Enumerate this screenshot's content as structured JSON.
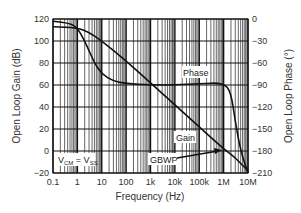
{
  "chart_data": {
    "type": "line",
    "title": "",
    "xlabel": "Frequency (Hz)",
    "ylabel": "Open Loop Gain (dB)",
    "y2label": "Open Loop Phase (°)",
    "xscale": "log",
    "xlim": [
      0.1,
      10000000
    ],
    "ylim": [
      -20,
      120
    ],
    "y2lim": [
      -210,
      0
    ],
    "grid": true,
    "x_ticks": [
      "0.1",
      "1",
      "10",
      "100",
      "1k",
      "10k",
      "100k",
      "1M",
      "10M"
    ],
    "y_ticks": [
      "120",
      "100",
      "80",
      "60",
      "40",
      "20",
      "0",
      "-20"
    ],
    "y2_ticks": [
      "0",
      "-30",
      "-60",
      "-90",
      "-120",
      "-150",
      "-180",
      "-210"
    ],
    "series": [
      {
        "name": "Gain",
        "axis": "left",
        "x": [
          0.1,
          1,
          3,
          10,
          100,
          1000,
          10000,
          100000,
          1000000,
          3000000,
          10000000
        ],
        "y": [
          113,
          112,
          108,
          100,
          82,
          62,
          42,
          22,
          2,
          -6,
          -18
        ]
      },
      {
        "name": "Phase",
        "axis": "right",
        "x": [
          0.1,
          0.5,
          1,
          2,
          5,
          10,
          30,
          100,
          1000,
          10000,
          100000,
          1000000,
          2000000,
          3000000,
          5000000,
          10000000
        ],
        "y": [
          -3,
          -6,
          -12,
          -30,
          -60,
          -75,
          -85,
          -88,
          -90,
          -90,
          -88,
          -87,
          -100,
          -140,
          -180,
          -210
        ]
      }
    ],
    "annotations": [
      {
        "text": "Phase",
        "target": "Phase curve"
      },
      {
        "text": "Gain",
        "target": "Gain curve"
      },
      {
        "text": "GBWP",
        "target": "gain crossing 0 dB near 1M Hz",
        "arrow": true
      },
      {
        "text": "V_CM = V_SS",
        "position": "lower-left"
      }
    ]
  },
  "labels": {
    "xlabel": "Frequency (Hz)",
    "ylabel": "Open Loop Gain (dB)",
    "y2label": "Open Loop Phase (°)",
    "phase": "Phase",
    "gain": "Gain",
    "gbwp": "GBWP",
    "vcm_main": "V",
    "vcm_sub": "CM",
    "vcm_eq": " = V",
    "vss_sub": "SS"
  }
}
